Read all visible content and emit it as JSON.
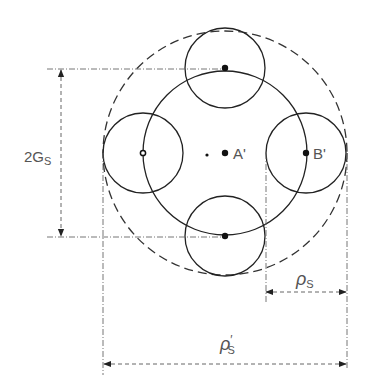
{
  "diagram": {
    "title": "",
    "points": [
      {
        "id": "A",
        "label": "A'",
        "x": 225,
        "y": 153
      },
      {
        "id": "B",
        "label": "B'",
        "x": 306,
        "y": 153
      }
    ],
    "small_dot": {
      "x": 207,
      "y": 155
    },
    "central_circle": {
      "cx": 225,
      "cy": 153,
      "r": 82
    },
    "outer_dashed_circle": {
      "cx": 225,
      "cy": 153,
      "r": 122
    },
    "satellite_circles": [
      {
        "cx": 225,
        "cy": 68,
        "r": 40
      },
      {
        "cx": 143,
        "cy": 153,
        "r": 40
      },
      {
        "cx": 306,
        "cy": 153,
        "r": 40
      },
      {
        "cx": 225,
        "cy": 236,
        "r": 40
      }
    ],
    "dimensions": {
      "vertical": {
        "label_main": "2G",
        "label_sub": "S"
      },
      "rho_s": {
        "label_main": "ρ",
        "label_sub": "S"
      },
      "rho_s_prime": {
        "label_main": "ρ",
        "label_prime": "′",
        "label_sub": "S"
      }
    }
  }
}
